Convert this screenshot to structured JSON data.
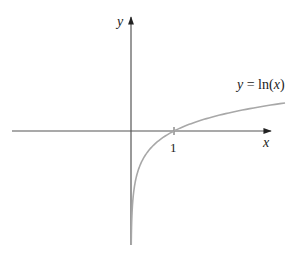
{
  "chart_data": {
    "type": "line",
    "title": "",
    "function": "ln(x)",
    "curve_label": "y = ln(x)",
    "xlabel": "x",
    "ylabel": "y",
    "x_ticks": [
      {
        "value": 1,
        "label": "1"
      }
    ],
    "y_ticks": [],
    "grid": false,
    "legend": "none",
    "series": [
      {
        "name": "y = ln(x)",
        "x": [
          0.1,
          0.25,
          0.5,
          1,
          2,
          3,
          4,
          5
        ],
        "values": [
          -2.3,
          -1.39,
          -0.69,
          0,
          0.69,
          1.1,
          1.39,
          1.61
        ]
      }
    ],
    "xlim": [
      -2.9,
      3.2
    ],
    "ylim": [
      -2.7,
      2.6
    ]
  },
  "labels": {
    "y_axis": "y",
    "x_axis": "x",
    "tick_one": "1",
    "curve_y": "y",
    "curve_eq": " = ln(",
    "curve_x": "x",
    "curve_close": ")"
  },
  "colors": {
    "axis": "#555555",
    "curve": "#a8a8a8",
    "text": "#222222",
    "background": "#ffffff"
  }
}
